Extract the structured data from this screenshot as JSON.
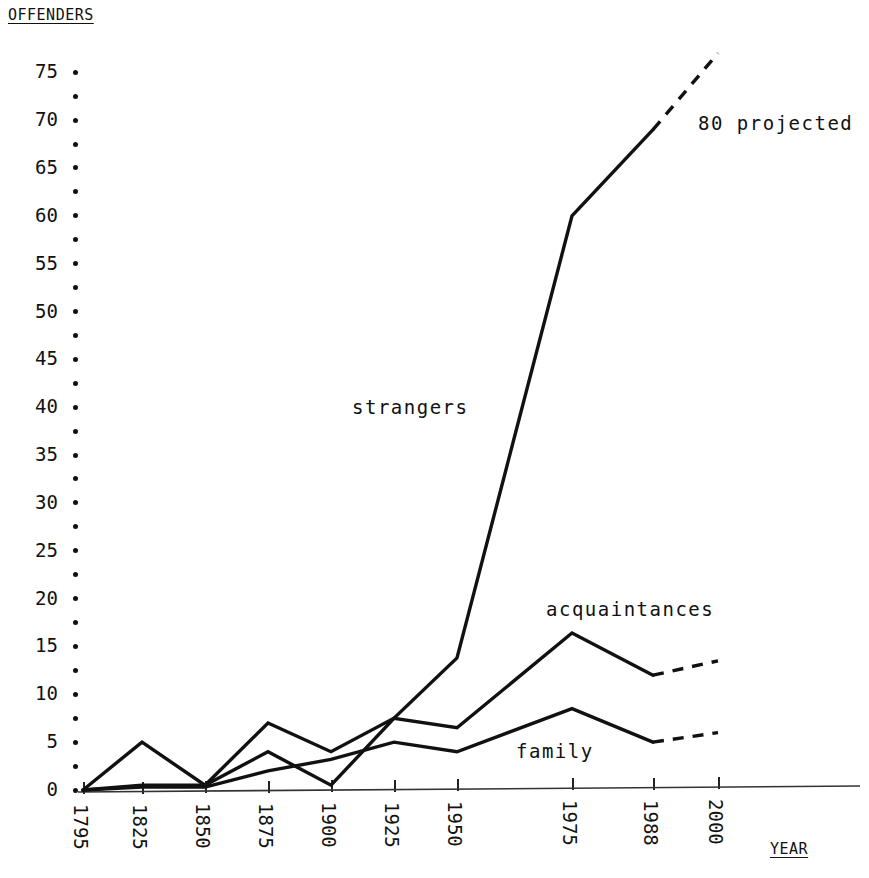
{
  "chart_data": {
    "type": "line",
    "title": "",
    "subtitle": "",
    "ylabel": "OFFENDERS",
    "xlabel": "YEAR",
    "grid": false,
    "legend_position": "inline-annotations",
    "x": [
      "1795",
      "1825",
      "1850",
      "1875",
      "1900",
      "1925",
      "1950",
      "1975",
      "1988",
      "2000"
    ],
    "xtick_labels": [
      "1795",
      "1825",
      "1850",
      "1875",
      "1900",
      "1925",
      "1950",
      "1975",
      "1988",
      "2000"
    ],
    "ytick_labels": [
      "0",
      "5",
      "10",
      "15",
      "20",
      "25",
      "30",
      "35",
      "40",
      "45",
      "50",
      "55",
      "60",
      "65",
      "70",
      "75"
    ],
    "ylim": [
      0,
      77
    ],
    "ytick_step": 5,
    "minor_ticks": true,
    "series": [
      {
        "name": "strangers",
        "label": "strangers",
        "values": [
          0,
          5,
          0.5,
          7,
          4,
          7.5,
          13.8,
          60,
          69,
          77
        ],
        "projected_from": "1988",
        "projected_values": [
          69,
          77
        ],
        "style": "solid-with-dashed-projection"
      },
      {
        "name": "acquaintances",
        "label": "acquaintances",
        "values": [
          0,
          0.5,
          0.5,
          4,
          0.5,
          7.5,
          6.5,
          16.4,
          12,
          13.5
        ],
        "projected_from": "1988",
        "projected_values": [
          12,
          13.5
        ],
        "style": "solid-with-dashed-projection"
      },
      {
        "name": "family",
        "label": "family",
        "values": [
          0,
          0.3,
          0.3,
          2,
          3.2,
          5,
          4,
          8.5,
          5,
          6
        ],
        "projected_from": "1988",
        "projected_values": [
          5,
          6
        ],
        "style": "solid-with-dashed-projection"
      }
    ],
    "annotations": [
      {
        "name": "projected-note",
        "text": "80 projected"
      }
    ]
  },
  "labels": {
    "offenders": "OFFENDERS",
    "year": "YEAR",
    "strangers": "strangers",
    "acquaintances": "acquaintances",
    "family": "family",
    "projected": "80 projected"
  },
  "colors": {
    "ink": "#111111",
    "background": "#ffffff"
  }
}
